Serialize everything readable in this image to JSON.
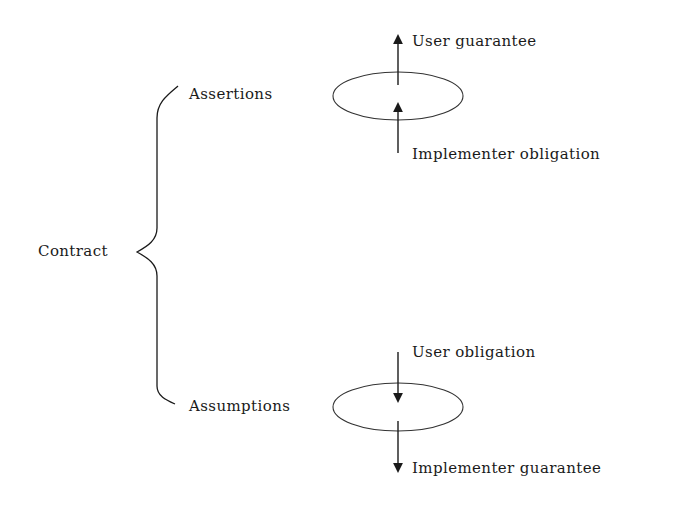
{
  "diagram": {
    "root": {
      "label": "Contract"
    },
    "branches": [
      {
        "label": "Assertions",
        "arrow_direction": "up",
        "top_label": "User guarantee",
        "bottom_label": "Implementer obligation"
      },
      {
        "label": "Assumptions",
        "arrow_direction": "down",
        "top_label": "User obligation",
        "bottom_label": "Implementer guarantee"
      }
    ],
    "colors": {
      "stroke": "#1a1a1a",
      "background": "#ffffff"
    }
  }
}
